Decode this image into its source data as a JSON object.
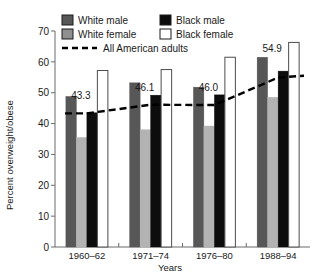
{
  "chart_data": {
    "type": "bar",
    "title": "",
    "xlabel": "Years",
    "ylabel": "Percent overweight/obese",
    "categories": [
      "1960–62",
      "1971–74",
      "1976–80",
      "1988–94"
    ],
    "ylim": [
      0,
      70
    ],
    "yticks": [
      0,
      10,
      20,
      30,
      40,
      50,
      60,
      70
    ],
    "grid": false,
    "legend_position": "top",
    "series": [
      {
        "name": "White male",
        "color": "#575757",
        "values": [
          48.8,
          53.2,
          51.8,
          61.5
        ]
      },
      {
        "name": "White female",
        "color": "#b3b3b3",
        "values": [
          35.5,
          38.0,
          39.2,
          48.5
        ]
      },
      {
        "name": "Black male",
        "color": "#0d0d0d",
        "values": [
          43.5,
          49.2,
          49.3,
          57.0
        ]
      },
      {
        "name": "Black female",
        "color": "#ffffff",
        "values": [
          57.2,
          57.5,
          61.5,
          66.3
        ]
      }
    ],
    "overlay_line": {
      "name": "All American adults",
      "style": "dashed",
      "color": "#000000",
      "values": [
        43.3,
        46.1,
        46.0,
        54.9
      ],
      "labels": [
        "43.3",
        "46.1",
        "46.0",
        "54.9"
      ]
    }
  },
  "axes": {
    "y_title": "Percent overweight/obese",
    "x_title": "Years",
    "y_tick_labels": [
      "70",
      "60",
      "50",
      "40",
      "30",
      "20",
      "10",
      "0"
    ],
    "x_tick_labels": [
      "1960–62",
      "1971–74",
      "1976–80",
      "1988–94"
    ]
  },
  "legend": {
    "entries": [
      {
        "label": "White male",
        "swatch": "dark-gray"
      },
      {
        "label": "Black male",
        "swatch": "black"
      },
      {
        "label": "White female",
        "swatch": "light-gray"
      },
      {
        "label": "Black female",
        "swatch": "white-outline"
      }
    ],
    "line_entry": {
      "label": "All American adults",
      "swatch": "dashed-line"
    }
  },
  "data_labels": [
    "43.3",
    "46.1",
    "46.0",
    "54.9"
  ]
}
